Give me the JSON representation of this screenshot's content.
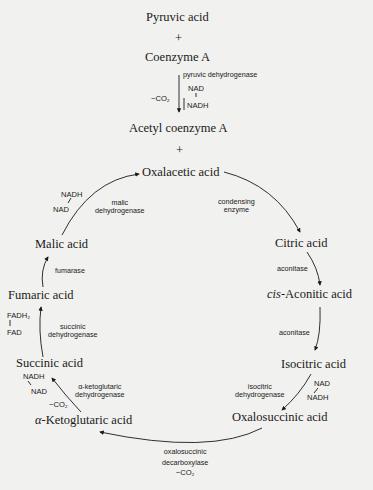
{
  "entry": {
    "reactant1": "Pyruvic acid",
    "plus1": "+",
    "reactant2": "Coenzyme A",
    "enzyme": "pyruvic dehydrogenase",
    "co2": "−CO₂",
    "cofactor_in": "NAD",
    "cofactor_out": "NADH",
    "product": "Acetyl coenzyme A",
    "plus2": "+"
  },
  "cycle": {
    "compounds": [
      {
        "id": "oxalacetic",
        "label": "Oxalacetic acid"
      },
      {
        "id": "citric",
        "label": "Citric acid"
      },
      {
        "id": "cis-aconitic",
        "prefix": "cis-",
        "label": "Aconitic acid"
      },
      {
        "id": "isocitric",
        "label": "Isocitric acid"
      },
      {
        "id": "oxalosuccinic",
        "label": "Oxalosuccinic acid"
      },
      {
        "id": "alpha-ketoglutaric",
        "prefix": "α-",
        "label": "Ketoglutaric acid"
      },
      {
        "id": "succinic",
        "label": "Succinic acid"
      },
      {
        "id": "fumaric",
        "label": "Fumaric acid"
      },
      {
        "id": "malic",
        "label": "Malic acid"
      }
    ],
    "enzymes": {
      "condensing": [
        "condensing",
        "enzyme"
      ],
      "aconitase1": "aconitase",
      "aconitase2": "aconitase",
      "isocitric_dh": [
        "isocitric",
        "dehydrogenase"
      ],
      "oxalosuccinic_dc": [
        "oxalosuccinic",
        "decarboxylase"
      ],
      "oxalosuccinic_co2": "−CO₂",
      "akg_dh": [
        "α-ketoglutaric",
        "dehydrogenase"
      ],
      "akg_co2": "−CO₂",
      "succinic_dh": [
        "succinic",
        "dehydrogenase"
      ],
      "fumarase": "fumarase",
      "malic_dh": [
        "malic",
        "dehydrogenase"
      ]
    },
    "cofactors": {
      "isocitric": {
        "in": "NAD",
        "out": "NADH"
      },
      "akg": {
        "out": "NADH",
        "in": "NAD"
      },
      "succinic": {
        "out": "FADH₂",
        "in": "FAD"
      },
      "malic": {
        "out": "NADH",
        "in": "NAD"
      }
    }
  }
}
